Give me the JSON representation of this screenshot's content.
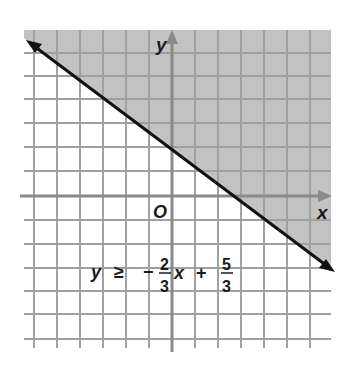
{
  "graph": {
    "title": "Graph of linear inequality",
    "x_axis_label": "x",
    "y_axis_label": "y",
    "origin_label": "O",
    "grid": {
      "cell_px": 23.3,
      "x_range_units": [
        -6,
        6
      ],
      "y_range_units": [
        -6,
        7
      ]
    },
    "boundary_line": {
      "slope": "-2/3",
      "intercept": "5/3",
      "style": "solid",
      "arrows": "both"
    },
    "shaded_region": "above the line",
    "colors": {
      "shade": "#c2c2c2",
      "grid": "#a0a0a0",
      "axes": "#8a8a8a",
      "line": "#111111",
      "text": "#1a1a1a"
    }
  },
  "inequality": {
    "lhs": "y",
    "relation": "≥",
    "sign": "−",
    "coef_num": "2",
    "coef_den": "3",
    "var": "x",
    "plus": "+",
    "const_num": "5",
    "const_den": "3",
    "full_text": "y ≥ −2/3x + 5/3"
  }
}
